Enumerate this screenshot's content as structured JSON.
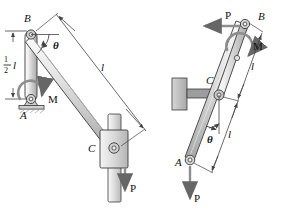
{
  "figure": {
    "type": "engineering-mechanics-diagram",
    "colors": {
      "outline": "#3a3a3a",
      "link_fill_light": "#f2f2f2",
      "link_fill_mid": "#d8d8d8",
      "link_fill_dark": "#b8b8b8",
      "support_fill": "#cfcfcf",
      "wall_fill": "#bfbfbf",
      "rod_fill": "#dedede",
      "arrow": "#555555",
      "text": "#111111"
    }
  },
  "left_figure": {
    "name": "left-mechanism",
    "labels": {
      "point_b": "B",
      "point_a": "A",
      "point_c": "C",
      "moment": "M",
      "force": "P",
      "angle": "θ",
      "length_full": "l",
      "length_half_num": "1",
      "length_half_den": "2",
      "length_half_sym": "l"
    }
  },
  "right_figure": {
    "name": "right-mechanism",
    "labels": {
      "point_b": "B",
      "point_a": "A",
      "point_c": "C",
      "moment": "M",
      "force_top": "P",
      "force_bottom": "P",
      "angle": "θ",
      "length_upper": "l",
      "length_lower": "l"
    }
  }
}
